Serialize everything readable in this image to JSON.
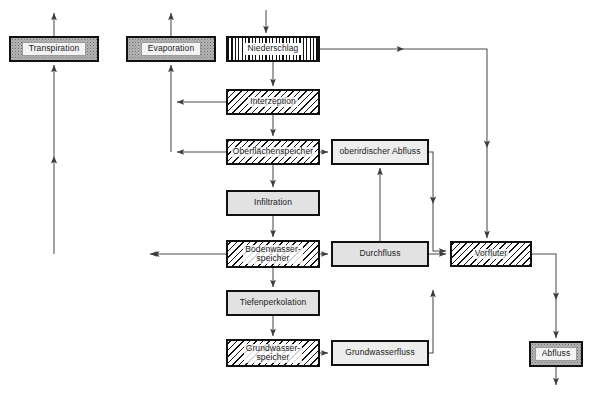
{
  "diagram": {
    "background_color": "#ffffff",
    "line_color": "#4d4d4d",
    "border_color": "#111111",
    "width": 592,
    "height": 394
  },
  "nodes": [
    {
      "id": "transpiration",
      "label": "Transpiration",
      "x": 9,
      "y": 36,
      "w": 90,
      "h": 26,
      "style": "stipple"
    },
    {
      "id": "evaporation",
      "label": "Evaporation",
      "x": 126,
      "y": 36,
      "w": 90,
      "h": 26,
      "style": "stipple"
    },
    {
      "id": "niederschlag",
      "label": "Niederschlag",
      "x": 226,
      "y": 36,
      "w": 94,
      "h": 26,
      "style": "vhatch"
    },
    {
      "id": "interzeption",
      "label": "Interzeption",
      "x": 226,
      "y": 89,
      "w": 94,
      "h": 26,
      "style": "dhatch"
    },
    {
      "id": "oberflaechenspeicher",
      "label": "Oberflächenspeicher",
      "x": 226,
      "y": 139,
      "w": 94,
      "h": 26,
      "style": "dhatch"
    },
    {
      "id": "infiltration",
      "label": "Infiltration",
      "x": 226,
      "y": 190,
      "w": 94,
      "h": 26,
      "style": "gray"
    },
    {
      "id": "bodenwasserspeicher",
      "label": "Bodenwasser-\nspeicher",
      "x": 226,
      "y": 240,
      "w": 94,
      "h": 28,
      "style": "dhatch"
    },
    {
      "id": "tiefenperkolation",
      "label": "Tiefenperkolation",
      "x": 226,
      "y": 290,
      "w": 94,
      "h": 26,
      "style": "gray"
    },
    {
      "id": "grundwasserspeicher",
      "label": "Grundwasser-\nspeicher",
      "x": 226,
      "y": 339,
      "w": 94,
      "h": 28,
      "style": "dhatch"
    },
    {
      "id": "oberirdischer-abfluss",
      "label": "oberirdischer Abfluss",
      "x": 331,
      "y": 139,
      "w": 98,
      "h": 26,
      "style": "white"
    },
    {
      "id": "durchfluss",
      "label": "Durchfluss",
      "x": 331,
      "y": 241,
      "w": 98,
      "h": 26,
      "style": "gray"
    },
    {
      "id": "grundwasserfluss",
      "label": "Grundwasserfluss",
      "x": 331,
      "y": 340,
      "w": 98,
      "h": 26,
      "style": "white"
    },
    {
      "id": "vorfluter",
      "label": "Vorfluter",
      "x": 450,
      "y": 241,
      "w": 82,
      "h": 26,
      "style": "dhatch"
    },
    {
      "id": "abfluss",
      "label": "Abfluss",
      "x": 529,
      "y": 341,
      "w": 54,
      "h": 26,
      "style": "stipple"
    }
  ],
  "edges": [
    {
      "id": "transpiration-out-up",
      "from": "transpiration",
      "to": "(out, up)"
    },
    {
      "id": "evaporation-out-up",
      "from": "evaporation",
      "to": "(out, up)"
    },
    {
      "id": "niederschlag-in-down",
      "from": "(in, down)",
      "to": "niederschlag"
    },
    {
      "id": "bodenwasserspeicher-to-transpiration",
      "from": "bodenwasserspeicher",
      "to": "transpiration"
    },
    {
      "id": "interzeption-to-evaporation",
      "from": "interzeption",
      "to": "evaporation"
    },
    {
      "id": "oberflaechenspeicher-to-evaporation",
      "from": "oberflaechenspeicher",
      "to": "evaporation"
    },
    {
      "id": "niederschlag-to-interzeption",
      "from": "niederschlag",
      "to": "interzeption"
    },
    {
      "id": "niederschlag-to-vorfluter",
      "from": "niederschlag",
      "to": "vorfluter"
    },
    {
      "id": "interzeption-to-oberflaechenspeicher",
      "from": "interzeption",
      "to": "oberflaechenspeicher"
    },
    {
      "id": "oberflaechenspeicher-to-infiltration",
      "from": "oberflaechenspeicher",
      "to": "infiltration"
    },
    {
      "id": "oberflaechenspeicher-to-oberirdischer-abfluss",
      "from": "oberflaechenspeicher",
      "to": "oberirdischer-abfluss"
    },
    {
      "id": "infiltration-to-bodenwasserspeicher",
      "from": "infiltration",
      "to": "bodenwasserspeicher"
    },
    {
      "id": "bodenwasserspeicher-to-durchfluss",
      "from": "bodenwasserspeicher",
      "to": "durchfluss"
    },
    {
      "id": "bodenwasserspeicher-to-tiefenperkolation",
      "from": "bodenwasserspeicher",
      "to": "tiefenperkolation"
    },
    {
      "id": "durchfluss-to-oberirdischer-abfluss",
      "from": "durchfluss",
      "to": "oberirdischer-abfluss"
    },
    {
      "id": "oberirdischer-abfluss-to-vorfluter",
      "from": "oberirdischer-abfluss",
      "to": "vorfluter"
    },
    {
      "id": "durchfluss-to-vorfluter",
      "from": "durchfluss",
      "to": "vorfluter"
    },
    {
      "id": "tiefenperkolation-to-grundwasserspeicher",
      "from": "tiefenperkolation",
      "to": "grundwasserspeicher"
    },
    {
      "id": "grundwasserspeicher-to-grundwasserfluss",
      "from": "grundwasserspeicher",
      "to": "grundwasserfluss"
    },
    {
      "id": "grundwasserfluss-to-vorfluter",
      "from": "grundwasserfluss",
      "to": "vorfluter"
    },
    {
      "id": "vorfluter-to-abfluss",
      "from": "vorfluter",
      "to": "abfluss"
    },
    {
      "id": "abfluss-out-down",
      "from": "abfluss",
      "to": "(out, down)"
    }
  ]
}
